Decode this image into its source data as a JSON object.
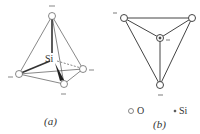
{
  "figure_a": {
    "caption": "(a)",
    "center_label": "Si",
    "charge": "–"
  },
  "figure_b": {
    "caption": "(b)",
    "charge": "–"
  },
  "legend": {
    "oxygen_label": "O",
    "silicon_label": "Si"
  },
  "colors": {
    "line": "#444444",
    "text": "#333333"
  }
}
